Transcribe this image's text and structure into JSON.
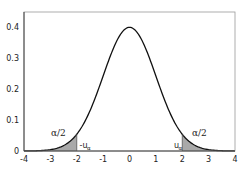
{
  "chart_data": {
    "type": "area",
    "title": "",
    "xlabel": "",
    "ylabel": "",
    "xlim": [
      -4,
      4
    ],
    "ylim": [
      0,
      0.44
    ],
    "grid": false,
    "legend": null,
    "x_ticks": [
      "-4",
      "-3",
      "-2",
      "-1",
      "0",
      "1",
      "2",
      "3",
      "4"
    ],
    "y_ticks": [
      "0",
      "0.1",
      "0.2",
      "0.3",
      "0.4"
    ],
    "series": [
      {
        "name": "standard normal density",
        "x": [
          -4,
          -3.5,
          -3,
          -2.5,
          -2,
          -1.5,
          -1,
          -0.5,
          0,
          0.5,
          1,
          1.5,
          2,
          2.5,
          3,
          3.5,
          4
        ],
        "values": [
          0.0001,
          0.0009,
          0.0044,
          0.0175,
          0.054,
          0.1295,
          0.242,
          0.3521,
          0.3989,
          0.3521,
          0.242,
          0.1295,
          0.054,
          0.0175,
          0.0044,
          0.0009,
          0.0001
        ]
      }
    ],
    "shaded_regions": [
      {
        "from": -4,
        "to": -2,
        "color": "#a9a9a9",
        "label": "α/2"
      },
      {
        "from": 2,
        "to": 4,
        "color": "#a9a9a9",
        "label": "α/2"
      }
    ],
    "annotations": [
      {
        "text": "α/2",
        "x": -2.8,
        "y": 0.07
      },
      {
        "text": "-u",
        "subscript": "α",
        "x": -1.85,
        "y": 0.02
      },
      {
        "text": "u",
        "subscript": "α",
        "x": 1.75,
        "y": 0.02
      },
      {
        "text": "α/2",
        "x": 2.8,
        "y": 0.07
      }
    ]
  },
  "labels": {
    "alpha_half_left": "α/2",
    "alpha_half_right": "α/2",
    "neg_u": "-u",
    "pos_u": "u",
    "sub_alpha": "α"
  }
}
